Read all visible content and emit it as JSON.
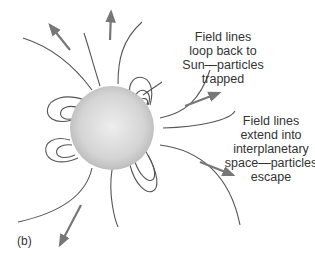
{
  "diagram": {
    "panel_label": "(b)",
    "central_body": "Sun",
    "annotations": [
      {
        "id": "closed-field",
        "lines": [
          "Field lines",
          "loop back to",
          "Sun—particles",
          "trapped"
        ]
      },
      {
        "id": "open-field",
        "lines": [
          "Field lines",
          "extend into",
          "interplanetary",
          "space—particles",
          "escape"
        ]
      }
    ],
    "colors": {
      "field_line": "#555555",
      "arrow": "#777777",
      "sun_center": "#e6e6e6",
      "sun_edge": "#bdbdbd",
      "text": "#333333"
    }
  }
}
